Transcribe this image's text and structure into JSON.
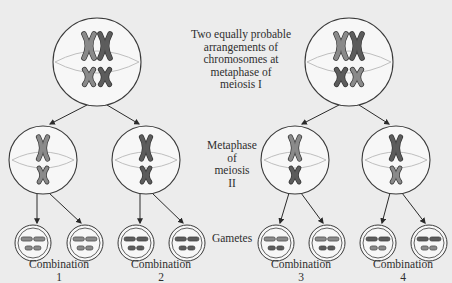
{
  "labels": {
    "meiosis_one": [
      "Two equally probable",
      "arrangements of",
      "chromosomes at",
      "metaphase of",
      "meiosis I"
    ],
    "meiosis_two": [
      "Metaphase",
      "of",
      "meiosis",
      "II"
    ],
    "gametes": "Gametes",
    "combinations": [
      {
        "title": "Combination",
        "number": "1"
      },
      {
        "title": "Combination",
        "number": "2"
      },
      {
        "title": "Combination",
        "number": "3"
      },
      {
        "title": "Combination",
        "number": "4"
      }
    ]
  },
  "colors": {
    "background": "#ececec",
    "cell_fill": "#f7f7f7",
    "cell_outline": "#3a3a3a",
    "spindle": "#b8b8b8",
    "chromosome_light": "#8a8a8a",
    "chromosome_dark": "#5c5c5c",
    "text": "#2e2e2e"
  },
  "diagram": {
    "metaphase_one_cells": [
      {
        "name": "arrangement-1",
        "cx": 97,
        "cy": 62,
        "r": 44,
        "large": [
          "light",
          "dark"
        ],
        "small": [
          "light",
          "dark"
        ]
      },
      {
        "name": "arrangement-2",
        "cx": 349,
        "cy": 62,
        "r": 44,
        "large": [
          "light",
          "dark"
        ],
        "small": [
          "dark",
          "light"
        ]
      }
    ],
    "metaphase_two_cells": [
      {
        "cx": 43,
        "cy": 160,
        "r": 34,
        "large": "light",
        "small": "light"
      },
      {
        "cx": 146,
        "cy": 160,
        "r": 34,
        "large": "dark",
        "small": "dark"
      },
      {
        "cx": 295,
        "cy": 160,
        "r": 34,
        "large": "light",
        "small": "dark"
      },
      {
        "cx": 396,
        "cy": 160,
        "r": 34,
        "large": "dark",
        "small": "light"
      }
    ],
    "gametes": [
      {
        "cx": 33,
        "large": "light",
        "small": "light",
        "combination": 1
      },
      {
        "cx": 85,
        "large": "light",
        "small": "light",
        "combination": 1
      },
      {
        "cx": 136,
        "large": "dark",
        "small": "dark",
        "combination": 2
      },
      {
        "cx": 187,
        "large": "dark",
        "small": "dark",
        "combination": 2
      },
      {
        "cx": 276,
        "large": "light",
        "small": "dark",
        "combination": 3
      },
      {
        "cx": 327,
        "large": "light",
        "small": "dark",
        "combination": 3
      },
      {
        "cx": 378,
        "large": "dark",
        "small": "light",
        "combination": 4
      },
      {
        "cx": 429,
        "large": "dark",
        "small": "light",
        "combination": 4
      }
    ]
  }
}
